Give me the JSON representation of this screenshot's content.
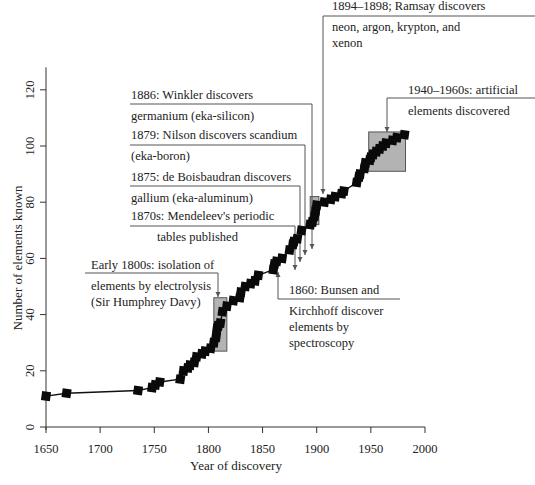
{
  "chart_data": {
    "type": "line",
    "title": "",
    "xlabel": "Year of discovery",
    "ylabel": "Number of elements known",
    "xlim": [
      1650,
      2000
    ],
    "ylim": [
      0,
      128
    ],
    "xticks": [
      1650,
      1700,
      1750,
      1800,
      1850,
      1900,
      1950,
      2000
    ],
    "yticks": [
      0,
      20,
      40,
      60,
      80,
      100,
      120
    ],
    "grid": false,
    "legend": null,
    "series": [
      {
        "name": "Elements known",
        "marker": "square",
        "x": [
          1650,
          1669,
          1735,
          1748,
          1751,
          1755,
          1774,
          1777,
          1781,
          1783,
          1787,
          1789,
          1794,
          1797,
          1802,
          1805,
          1807,
          1808,
          1809,
          1811,
          1813,
          1817,
          1823,
          1829,
          1830,
          1834,
          1839,
          1843,
          1846,
          1860,
          1861,
          1863,
          1868,
          1875,
          1878,
          1879,
          1882,
          1886,
          1894,
          1896,
          1898,
          1899,
          1900,
          1907,
          1913,
          1917,
          1923,
          1925,
          1937,
          1939,
          1940,
          1944,
          1945,
          1949,
          1950,
          1952,
          1955,
          1958,
          1961,
          1964,
          1970,
          1974,
          1981
        ],
        "y": [
          11,
          12,
          13,
          14,
          15,
          16,
          17,
          20,
          21,
          22,
          23,
          25,
          26,
          27,
          28,
          30,
          32,
          35,
          36,
          37,
          41,
          43,
          45,
          46,
          48,
          50,
          51,
          52,
          54,
          56,
          58,
          59,
          60,
          63,
          65,
          66,
          67,
          70,
          72,
          73,
          75,
          77,
          79,
          80,
          81,
          82,
          83,
          84,
          87,
          89,
          90,
          92,
          94,
          95,
          96,
          97,
          98,
          99,
          100,
          101,
          102,
          103,
          104
        ]
      }
    ],
    "highlight_boxes": [
      {
        "x0": 1805,
        "x1": 1817,
        "y0": 27,
        "y1": 46,
        "label": "Early 1800s: isolation of elements by electrolysis (Sir Humphrey Davy)"
      },
      {
        "x0": 1894,
        "x1": 1902,
        "y0": 72,
        "y1": 82,
        "label": "1894–1898; Ramsay discovers neon, argon, krypton, and xenon"
      },
      {
        "x0": 1948,
        "x1": 1982,
        "y0": 91,
        "y1": 105,
        "label": "1940–1960s: artificial elements discovered"
      }
    ],
    "annotations": [
      {
        "id": "winkler",
        "lines": [
          "1886: Winkler discovers",
          "germanium (eka-silicon)"
        ],
        "points_to_year": 1886
      },
      {
        "id": "nilson",
        "lines": [
          "1879: Nilson discovers scandium",
          "(eka-boron)"
        ],
        "points_to_year": 1879
      },
      {
        "id": "boisbaudran",
        "lines": [
          "1875: de Boisbaudran discovers",
          "gallium (eka-aluminum)"
        ],
        "points_to_year": 1875
      },
      {
        "id": "mendeleev",
        "lines": [
          "1870s: Mendeleev's periodic",
          "tables published"
        ],
        "points_to_year": 1870
      },
      {
        "id": "davy",
        "lines": [
          "Early 1800s: isolation of",
          "elements by electrolysis",
          "(Sir Humphrey Davy)"
        ],
        "points_to_year": 1811
      },
      {
        "id": "bunsen",
        "lines": [
          "1860: Bunsen and",
          "Kirchhoff discover",
          "elements by",
          "spectroscopy"
        ],
        "points_to_year": 1860
      },
      {
        "id": "ramsay",
        "lines": [
          "1894–1898; Ramsay discovers",
          "neon, argon, krypton, and",
          "xenon"
        ],
        "points_to_year": 1898
      },
      {
        "id": "artificial",
        "lines": [
          "1940–1960s: artificial",
          "elements discovered"
        ],
        "points_to_year": 1955
      }
    ]
  }
}
